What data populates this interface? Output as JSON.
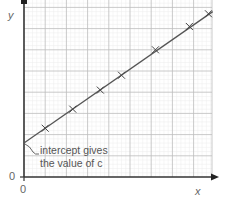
{
  "chart_data": {
    "type": "line",
    "title": "",
    "xlabel": "x",
    "ylabel": "y",
    "x_tick_labels": [
      "0"
    ],
    "y_tick_labels": [
      "0"
    ],
    "grid": true,
    "xlim": [
      0,
      9
    ],
    "ylim": [
      0,
      8.4
    ],
    "series": [
      {
        "name": "data points",
        "marker": "x",
        "points": [
          {
            "x": 1.0,
            "y": 2.3
          },
          {
            "x": 2.3,
            "y": 3.2
          },
          {
            "x": 3.6,
            "y": 4.1
          },
          {
            "x": 4.6,
            "y": 4.8
          },
          {
            "x": 6.2,
            "y": 6.0
          },
          {
            "x": 7.8,
            "y": 7.1
          },
          {
            "x": 8.7,
            "y": 7.7
          }
        ]
      },
      {
        "name": "line of best fit",
        "marker": "none",
        "points": [
          {
            "x": 0,
            "y": 1.6
          },
          {
            "x": 8.9,
            "y": 7.8
          }
        ]
      }
    ],
    "annotations": [
      {
        "text": "intercept gives the value of c",
        "x": 0,
        "y": 1.6
      }
    ]
  },
  "labels": {
    "y_axis": "y",
    "x_axis": "x",
    "origin_x": "0",
    "origin_y": "0",
    "annotation_line1": "intercept gives",
    "annotation_line2": "the value of c"
  },
  "colors": {
    "axis": "#333333",
    "grid_major": "#bdbdbd",
    "grid_minor": "#ececec",
    "line": "#555555",
    "text": "#666666"
  }
}
